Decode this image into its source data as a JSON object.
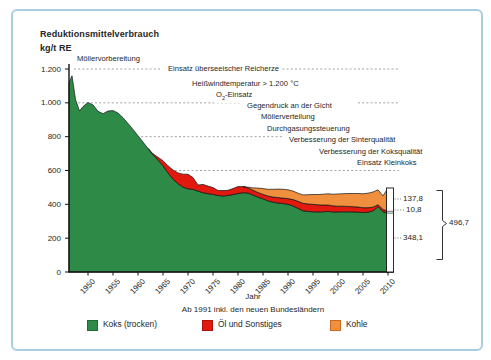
{
  "frame": {
    "border_color": "#a9cee2",
    "background": "#ffffff"
  },
  "title": {
    "line1": "Reduktionsmittelverbrauch",
    "line2": "kg/t RE"
  },
  "chart_data": {
    "type": "area",
    "stacked": true,
    "title": "Reduktionsmittelverbrauch kg/t RE",
    "xlabel": "Jahr",
    "x_note": "Ab 1991 inkl. den neuen Bundesländern",
    "ylabel": "kg/t RE",
    "ylim": [
      0,
      1200
    ],
    "y_ticks": [
      {
        "value": 0,
        "label": "0"
      },
      {
        "value": 200,
        "label": "200"
      },
      {
        "value": 400,
        "label": "400"
      },
      {
        "value": 600,
        "label": "600"
      },
      {
        "value": 800,
        "label": "800"
      },
      {
        "value": 1000,
        "label": "1.000"
      },
      {
        "value": 1200,
        "label": "1.200"
      }
    ],
    "x_ticks": [
      {
        "year": 1950,
        "label": "1950"
      },
      {
        "year": 1955,
        "label": "1955"
      },
      {
        "year": 1960,
        "label": "1960"
      },
      {
        "year": 1965,
        "label": "1965"
      },
      {
        "year": 1970,
        "label": "1970"
      },
      {
        "year": 1975,
        "label": "1975"
      },
      {
        "year": 1980,
        "label": "1980"
      },
      {
        "year": 1985,
        "label": "1985"
      },
      {
        "year": 1990,
        "label": "1990"
      },
      {
        "year": 1995,
        "label": "1995"
      },
      {
        "year": 2000,
        "label": "2000"
      },
      {
        "year": 2005,
        "label": "2005"
      },
      {
        "year": 2010,
        "label": "2010"
      }
    ],
    "series_names": [
      "Koks (trocken)",
      "Öl und Sonstiges",
      "Kohle"
    ],
    "colors": {
      "koks": "#2e8b47",
      "oel": "#e1190f",
      "kohle": "#f0903e",
      "outline": "#141414",
      "guide": "#999999",
      "axis": "#141414"
    },
    "points_format": [
      "year",
      "koks",
      "oel",
      "kohle"
    ],
    "points": [
      [
        1946.2,
        1120,
        0,
        0
      ],
      [
        1946.8,
        1160,
        0,
        0
      ],
      [
        1947.5,
        1020,
        0,
        0
      ],
      [
        1948.3,
        952,
        0,
        0
      ],
      [
        1949,
        978,
        0,
        0
      ],
      [
        1950,
        1002,
        0,
        0
      ],
      [
        1951,
        988,
        0,
        0
      ],
      [
        1952,
        950,
        0,
        0
      ],
      [
        1953,
        936,
        0,
        0
      ],
      [
        1954,
        952,
        0,
        0
      ],
      [
        1955,
        954,
        0,
        0
      ],
      [
        1956,
        940,
        0,
        0
      ],
      [
        1957,
        912,
        0,
        0
      ],
      [
        1958,
        878,
        0,
        0
      ],
      [
        1959,
        843,
        0,
        0
      ],
      [
        1960,
        806,
        0,
        0
      ],
      [
        1961,
        768,
        0,
        0
      ],
      [
        1962,
        730,
        0,
        0
      ],
      [
        1963,
        694,
        5,
        0
      ],
      [
        1964,
        662,
        16,
        0
      ],
      [
        1965,
        628,
        30,
        0
      ],
      [
        1966,
        586,
        42,
        0
      ],
      [
        1967,
        548,
        55,
        0
      ],
      [
        1968,
        522,
        64,
        0
      ],
      [
        1969,
        502,
        76,
        0
      ],
      [
        1970,
        492,
        86,
        0
      ],
      [
        1971,
        488,
        70,
        0
      ],
      [
        1972,
        478,
        36,
        0
      ],
      [
        1973,
        469,
        49,
        0
      ],
      [
        1974,
        463,
        45,
        0
      ],
      [
        1975,
        459,
        40,
        0
      ],
      [
        1976,
        452,
        30,
        0
      ],
      [
        1977,
        449,
        32,
        0
      ],
      [
        1978,
        452,
        31,
        0
      ],
      [
        1979,
        458,
        35,
        0
      ],
      [
        1980,
        464,
        41,
        0
      ],
      [
        1981,
        469,
        36,
        0
      ],
      [
        1982,
        467,
        30,
        4
      ],
      [
        1983,
        455,
        28,
        14
      ],
      [
        1984,
        443,
        27,
        26
      ],
      [
        1985,
        433,
        26,
        34
      ],
      [
        1986,
        421,
        28,
        40
      ],
      [
        1987,
        413,
        30,
        46
      ],
      [
        1988,
        408,
        32,
        50
      ],
      [
        1989,
        405,
        32,
        52
      ],
      [
        1990,
        400,
        34,
        52
      ],
      [
        1991,
        390,
        38,
        50
      ],
      [
        1992,
        376,
        42,
        48
      ],
      [
        1993,
        362,
        44,
        50
      ],
      [
        1994,
        358,
        44,
        55
      ],
      [
        1995,
        356,
        44,
        58
      ],
      [
        1996,
        355,
        42,
        61
      ],
      [
        1997,
        356,
        40,
        64
      ],
      [
        1998,
        358,
        38,
        66
      ],
      [
        1999,
        355,
        36,
        69
      ],
      [
        2000,
        355,
        34,
        72
      ],
      [
        2001,
        356,
        33,
        74
      ],
      [
        2002,
        356,
        32,
        76
      ],
      [
        2003,
        355,
        31,
        78
      ],
      [
        2004,
        354,
        30,
        80
      ],
      [
        2005,
        352,
        28,
        82
      ],
      [
        2006,
        354,
        26,
        86
      ],
      [
        2007,
        361,
        22,
        90
      ],
      [
        2008,
        386,
        12,
        88
      ],
      [
        2009,
        356,
        14,
        80
      ],
      [
        2010,
        348.1,
        10.8,
        137.8
      ]
    ],
    "annotations": [
      {
        "text": "Möllervorbereitung",
        "x": 73,
        "y": 57
      },
      {
        "text": "Einsatz überseeischer Reicherze",
        "x": 164,
        "y": 67
      },
      {
        "text": "Heißwindtemperatur > 1.200 °C",
        "x": 188,
        "y": 82
      },
      {
        "text": "O2-Einsatz",
        "x": 212,
        "y": 93
      },
      {
        "text": "Gegendruck an der Gicht",
        "x": 243,
        "y": 104
      },
      {
        "text": "Möllerverteilung",
        "x": 257,
        "y": 115
      },
      {
        "text": "Durchgasungssteuerung",
        "x": 263,
        "y": 127
      },
      {
        "text": "Verbesserung der Sinterqualität",
        "x": 285,
        "y": 138
      },
      {
        "text": "Verbesserung der Koksqualität",
        "x": 315,
        "y": 150
      },
      {
        "text": "Einsatz Kleinkoks",
        "x": 353,
        "y": 161
      }
    ],
    "guide_segments": [
      {
        "level": 1200,
        "x1": 72,
        "x2": 160
      },
      {
        "level": 1200,
        "x1": 272,
        "x2": 396
      },
      {
        "level": 1000,
        "x1": 72,
        "x2": 238
      },
      {
        "level": 1000,
        "x1": 356,
        "x2": 396
      },
      {
        "level": 800,
        "x1": 72,
        "x2": 281
      },
      {
        "level": 600,
        "x1": 72,
        "x2": 397
      }
    ],
    "end_bar": {
      "year": 2010,
      "total_value": 496.7,
      "segments": [
        {
          "name": "Kohle",
          "value": 137.8,
          "label": "137,8"
        },
        {
          "name": "Öl und Sonstiges",
          "value": 10.8,
          "label": "10,8"
        },
        {
          "name": "Koks (trocken)",
          "value": 348.1,
          "label": "348,1"
        }
      ],
      "total_label": "496,7",
      "labels": [
        {
          "text": "137,8",
          "x": 401,
          "y": 197,
          "leader_y": 197
        },
        {
          "text": "10,8",
          "x": 404,
          "y": 208,
          "leader_y": 208
        },
        {
          "text": "348,1",
          "x": 401,
          "y": 236,
          "leader_y": 236
        },
        {
          "text": "496,7",
          "x": 447,
          "y": 221
        }
      ]
    }
  },
  "legend": {
    "items": [
      {
        "label": "Koks (trocken)",
        "color": "#2e8b47",
        "border": "#1d6b33",
        "x": 85,
        "y": 317
      },
      {
        "label": "Öl und Sonstiges",
        "color": "#e1190f",
        "border": "#a8130b",
        "x": 200,
        "y": 317
      },
      {
        "label": "Kohle",
        "color": "#f0903e",
        "border": "#c96a20",
        "x": 328,
        "y": 317
      }
    ]
  }
}
